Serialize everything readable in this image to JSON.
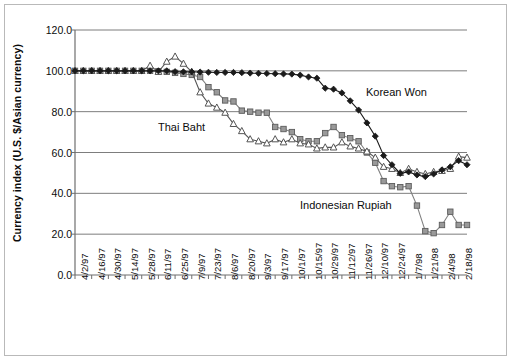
{
  "chart_data": {
    "type": "line",
    "title": "",
    "xlabel": "",
    "ylabel": "Currency index (U.S. $/Asian currency)",
    "ylim": [
      0,
      120
    ],
    "yticks": [
      0,
      20,
      40,
      60,
      80,
      100,
      120
    ],
    "ytick_labels": [
      "0.0",
      "20.0",
      "40.0",
      "60.0",
      "80.0",
      "100.0",
      "120.0"
    ],
    "grid": true,
    "grid_axis": "y",
    "legend_position": "inline-annotations",
    "categories": [
      "4/2/97",
      "4/9/97",
      "4/16/97",
      "4/23/97",
      "4/30/97",
      "5/7/97",
      "5/14/97",
      "5/21/97",
      "5/28/97",
      "6/4/97",
      "6/11/97",
      "6/18/97",
      "6/25/97",
      "7/2/97",
      "7/9/97",
      "7/16/97",
      "7/23/97",
      "7/30/97",
      "8/6/97",
      "8/13/97",
      "8/20/97",
      "8/27/97",
      "9/3/97",
      "9/10/97",
      "9/17/97",
      "9/24/97",
      "10/1/97",
      "10/8/97",
      "10/15/97",
      "10/22/97",
      "10/29/97",
      "11/5/97",
      "11/12/97",
      "11/19/97",
      "11/26/97",
      "12/3/97",
      "12/10/97",
      "12/17/97",
      "12/24/97",
      "12/31/97",
      "1/7/98",
      "1/14/98",
      "1/21/98",
      "1/28/98",
      "2/4/98",
      "2/11/98",
      "2/18/98",
      "2/25/98"
    ],
    "xtick_labels": [
      "4/2/97",
      "4/16/97",
      "4/30/97",
      "5/14/97",
      "5/28/97",
      "6/11/97",
      "6/25/97",
      "7/9/97",
      "7/23/97",
      "8/6/97",
      "8/20/97",
      "9/3/97",
      "9/17/97",
      "10/1/97",
      "10/15/97",
      "10/29/97",
      "11/12/97",
      "11/26/97",
      "12/10/97",
      "12/24/97",
      "1/7/98",
      "1/21/98",
      "2/4/98",
      "2/18/98"
    ],
    "series": [
      {
        "name": "Korean Won",
        "marker": "diamond",
        "color": "#1a1a1a",
        "fill": "#1a1a1a",
        "values": [
          100,
          100,
          100,
          100,
          100,
          100,
          100,
          100,
          100,
          100,
          100,
          100,
          99.6,
          99.5,
          99.5,
          99.4,
          99.3,
          99.2,
          99.2,
          99.2,
          99.1,
          98.9,
          98.8,
          98.7,
          98.6,
          98.5,
          98.4,
          97.9,
          97.0,
          96.4,
          91.5,
          91.0,
          89.2,
          85.3,
          80.8,
          74.5,
          68.0,
          58.5,
          54.0,
          49.8,
          50.5,
          49.0,
          48.2,
          49.5,
          51.5,
          53.0,
          56.0,
          54.0
        ]
      },
      {
        "name": "Thai Baht",
        "marker": "triangle-open",
        "color": "#555555",
        "fill": "#ffffff",
        "values": [
          100,
          100,
          100,
          100,
          100,
          100,
          100,
          100,
          100,
          102.5,
          99.5,
          104.5,
          107.0,
          103.5,
          99.5,
          89.5,
          84.0,
          82.0,
          79.5,
          74.0,
          70.5,
          66.5,
          65.5,
          64.5,
          66.5,
          65.0,
          66.5,
          64.5,
          64.0,
          62.0,
          62.5,
          62.5,
          65.0,
          63.0,
          62.0,
          60.5,
          57.5,
          53.0,
          52.0,
          50.0,
          52.0,
          50.5,
          49.5,
          50.5,
          51.0,
          52.0,
          58.0,
          57.5
        ]
      },
      {
        "name": "Indonesian Rupiah",
        "marker": "square",
        "color": "#808080",
        "fill": "#999999",
        "values": [
          100,
          100,
          100,
          100,
          100,
          100,
          100,
          100,
          100,
          100,
          99.8,
          99.5,
          99.0,
          98.5,
          98.0,
          97.0,
          92.0,
          89.5,
          85.5,
          85.0,
          80.5,
          80.0,
          79.5,
          79.5,
          72.5,
          71.5,
          70.0,
          66.5,
          65.5,
          65.5,
          69.5,
          72.5,
          68.5,
          67.0,
          65.5,
          60.0,
          55.0,
          46.0,
          43.5,
          43.0,
          43.5,
          34.0,
          21.5,
          20.5,
          24.5,
          31.0,
          24.5,
          24.5
        ]
      }
    ],
    "annotations": [
      {
        "text": "Korean Won",
        "x_px": 366,
        "y_px": 86
      },
      {
        "text": "Thai Baht",
        "x_px": 158,
        "y_px": 121
      },
      {
        "text": "Indonesian Rupiah",
        "x_px": 300,
        "y_px": 199
      }
    ]
  },
  "plot": {
    "left_px": 75,
    "right_px": 467,
    "top_px": 30,
    "bottom_px": 275
  }
}
